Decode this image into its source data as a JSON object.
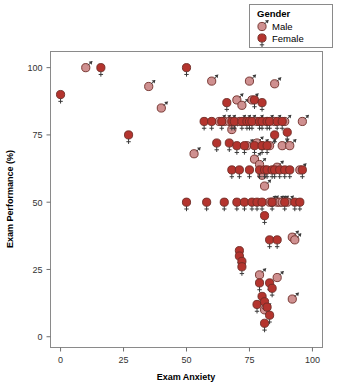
{
  "chart_data": {
    "type": "scatter",
    "title": "",
    "xlabel": "Exam Anxiety",
    "ylabel": "Exam Performance (%)",
    "xlim": [
      -4,
      104
    ],
    "ylim": [
      -4,
      106
    ],
    "xticks": [
      0,
      25,
      50,
      75,
      100
    ],
    "xtick_labels": [
      "0",
      "25",
      "50",
      "75",
      "100"
    ],
    "yticks": [
      0,
      25,
      50,
      75,
      100
    ],
    "ytick_labels": [
      "0",
      "25",
      "50",
      "75",
      "100"
    ],
    "grid": false,
    "legend": {
      "title": "Gender",
      "position": "top-right",
      "entries": [
        {
          "label": "Male",
          "marker": "mars-symbol",
          "color": "#cf9090"
        },
        {
          "label": "Female",
          "marker": "venus-symbol",
          "color": "#b4342e"
        }
      ]
    },
    "series": [
      {
        "name": "Male",
        "marker": "mars-symbol",
        "color": "#cf9090",
        "points": [
          [
            10,
            100
          ],
          [
            35,
            93
          ],
          [
            40,
            85
          ],
          [
            53,
            68
          ],
          [
            60,
            95
          ],
          [
            63,
            80
          ],
          [
            65,
            80
          ],
          [
            67,
            80
          ],
          [
            68,
            77
          ],
          [
            70,
            88
          ],
          [
            71,
            80
          ],
          [
            72,
            86
          ],
          [
            73,
            80
          ],
          [
            74,
            71
          ],
          [
            75,
            95
          ],
          [
            75,
            80
          ],
          [
            76,
            88
          ],
          [
            77,
            66
          ],
          [
            78,
            72
          ],
          [
            78,
            80
          ],
          [
            79,
            64
          ],
          [
            80,
            71
          ],
          [
            80,
            60
          ],
          [
            81,
            56
          ],
          [
            82,
            80
          ],
          [
            83,
            71
          ],
          [
            83,
            50
          ],
          [
            84,
            50
          ],
          [
            85,
            94
          ],
          [
            85,
            80
          ],
          [
            86,
            63
          ],
          [
            86,
            50
          ],
          [
            87,
            50
          ],
          [
            88,
            71
          ],
          [
            88,
            50
          ],
          [
            89,
            80
          ],
          [
            90,
            50
          ],
          [
            91,
            71
          ],
          [
            92,
            37
          ],
          [
            93,
            36
          ],
          [
            95,
            62
          ],
          [
            96,
            80
          ],
          [
            79,
            23
          ],
          [
            86,
            22
          ],
          [
            92,
            14
          ],
          [
            81,
            10
          ]
        ]
      },
      {
        "name": "Female",
        "marker": "venus-symbol",
        "color": "#b4342e",
        "points": [
          [
            0,
            90
          ],
          [
            16,
            100
          ],
          [
            27,
            75
          ],
          [
            50,
            100
          ],
          [
            50,
            50
          ],
          [
            57,
            80
          ],
          [
            58,
            50
          ],
          [
            60,
            80
          ],
          [
            62,
            72
          ],
          [
            64,
            80
          ],
          [
            65,
            50
          ],
          [
            66,
            87
          ],
          [
            67,
            72
          ],
          [
            68,
            62
          ],
          [
            68,
            80
          ],
          [
            69,
            80
          ],
          [
            70,
            71
          ],
          [
            70,
            50
          ],
          [
            71,
            62
          ],
          [
            72,
            80
          ],
          [
            73,
            71
          ],
          [
            73,
            50
          ],
          [
            74,
            80
          ],
          [
            75,
            80
          ],
          [
            75,
            62
          ],
          [
            76,
            80
          ],
          [
            76,
            50
          ],
          [
            77,
            88
          ],
          [
            77,
            71
          ],
          [
            78,
            50
          ],
          [
            79,
            80
          ],
          [
            79,
            62
          ],
          [
            80,
            87
          ],
          [
            80,
            80
          ],
          [
            80,
            71
          ],
          [
            80,
            50
          ],
          [
            81,
            62
          ],
          [
            81,
            45
          ],
          [
            82,
            80
          ],
          [
            82,
            71
          ],
          [
            82,
            62
          ],
          [
            83,
            80
          ],
          [
            83,
            36
          ],
          [
            84,
            62
          ],
          [
            84,
            50
          ],
          [
            85,
            75
          ],
          [
            85,
            62
          ],
          [
            86,
            80
          ],
          [
            86,
            36
          ],
          [
            87,
            62
          ],
          [
            88,
            80
          ],
          [
            89,
            62
          ],
          [
            89,
            50
          ],
          [
            90,
            76
          ],
          [
            91,
            62
          ],
          [
            93,
            50
          ],
          [
            95,
            50
          ],
          [
            96,
            62
          ],
          [
            71,
            32
          ],
          [
            71,
            30
          ],
          [
            72,
            28
          ],
          [
            72,
            26
          ],
          [
            79,
            20
          ],
          [
            83,
            20
          ],
          [
            80,
            15
          ],
          [
            78,
            12
          ],
          [
            81,
            13
          ],
          [
            82,
            11
          ],
          [
            83,
            8
          ],
          [
            81,
            5
          ],
          [
            84,
            18
          ]
        ]
      }
    ]
  }
}
